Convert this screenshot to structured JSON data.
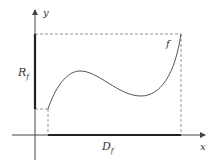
{
  "diagram": {
    "axes": {
      "x_label": "x",
      "y_label": "y"
    },
    "function_label": "f",
    "range_label": {
      "main": "R",
      "sub": "f"
    },
    "domain_label": {
      "main": "D",
      "sub": "f"
    },
    "colors": {
      "axis": "#444444",
      "curve": "#555555",
      "thick": "#222222",
      "dashed": "#777777"
    }
  }
}
